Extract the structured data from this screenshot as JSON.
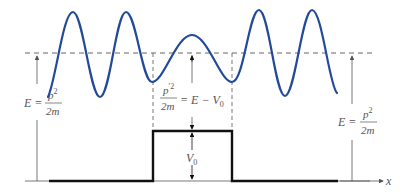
{
  "diagram": {
    "colors": {
      "wave": "#234a9a",
      "potential": "#111111",
      "guide": "#555555",
      "text": "#555555",
      "background": "#ffffff"
    },
    "labels": {
      "left_energy": {
        "lhs": "E =",
        "num": "p",
        "num_sup": "2",
        "den": "2m"
      },
      "right_energy": {
        "lhs": "E =",
        "num": "p",
        "num_sup": "2",
        "den": "2m"
      },
      "barrier_energy": {
        "num": "p",
        "num_sup": "′2",
        "den": "2m",
        "rhs": "= E − V",
        "rhs_sub": "0"
      },
      "barrier_height": {
        "main": "V",
        "sub": "0"
      },
      "x_axis": "x"
    },
    "geometry": {
      "energy_level_y": 53,
      "ground_y": 181,
      "barrier_top_y": 131,
      "barrier_left_x": 153,
      "barrier_right_x": 232
    }
  }
}
